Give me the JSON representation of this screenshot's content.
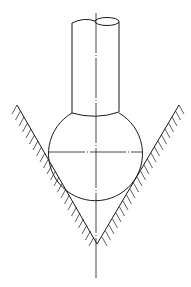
{
  "diagram": {
    "type": "technical-line-drawing",
    "colors": {
      "line": "#1a1a1a",
      "background": "#ffffff"
    },
    "components": [
      {
        "name": "shaft",
        "shape": "cylinder",
        "broken_top": true
      },
      {
        "name": "ball",
        "shape": "circle"
      },
      {
        "name": "v-groove",
        "shape": "v-notch",
        "hatched": true
      },
      {
        "name": "centerline",
        "style": "dash-dot",
        "orientation": "vertical"
      },
      {
        "name": "horizontal-diameter",
        "style": "dash-dot",
        "orientation": "horizontal"
      }
    ]
  }
}
